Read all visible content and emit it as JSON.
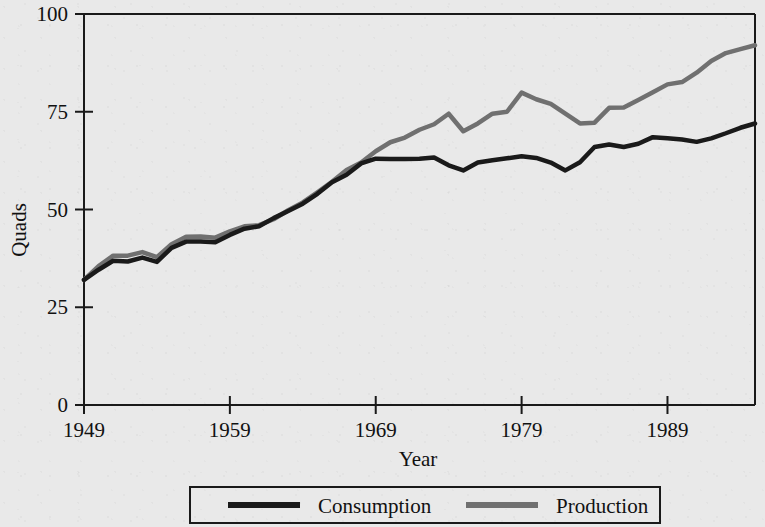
{
  "chart_data": {
    "type": "line",
    "title": "",
    "xlabel": "Year",
    "ylabel": "Quads",
    "xlim": [
      1949,
      1995
    ],
    "ylim": [
      0,
      100
    ],
    "xticks": [
      1949,
      1959,
      1969,
      1979,
      1989
    ],
    "yticks": [
      0,
      25,
      50,
      75,
      100
    ],
    "xtick_labels": [
      "1949",
      "1959",
      "1969",
      "1979",
      "1989"
    ],
    "ytick_labels": [
      "0",
      "25",
      "50",
      "75",
      "100"
    ],
    "grid": false,
    "legend_position": "bottom-outside",
    "x": [
      1949,
      1950,
      1951,
      1952,
      1953,
      1954,
      1955,
      1956,
      1957,
      1958,
      1959,
      1960,
      1961,
      1962,
      1963,
      1964,
      1965,
      1966,
      1967,
      1968,
      1969,
      1970,
      1971,
      1972,
      1973,
      1974,
      1975,
      1976,
      1977,
      1978,
      1979,
      1980,
      1981,
      1982,
      1983,
      1984,
      1985,
      1986,
      1987,
      1988,
      1989,
      1990,
      1991,
      1992,
      1993,
      1994,
      1995
    ],
    "series": [
      {
        "name": "Consumption",
        "color": "#1a1a1a",
        "values": [
          32.0,
          34.6,
          36.9,
          36.7,
          37.7,
          36.6,
          40.2,
          41.8,
          41.8,
          41.6,
          43.5,
          45.1,
          45.7,
          47.8,
          49.6,
          51.5,
          54.0,
          57.0,
          58.9,
          61.8,
          63.0,
          62.9,
          62.9,
          63.0,
          63.3,
          61.3,
          60.0,
          62.0,
          62.6,
          63.1,
          63.6,
          63.2,
          62.0,
          60.0,
          62.1,
          66.0,
          66.6,
          66.0,
          66.8,
          68.5,
          68.2,
          67.9,
          67.3,
          68.2,
          69.5,
          70.9,
          72.0
        ]
      },
      {
        "name": "Production",
        "color": "#707070",
        "values": [
          32.0,
          35.5,
          38.2,
          38.2,
          39.1,
          37.8,
          41.1,
          43.0,
          43.1,
          42.8,
          44.4,
          45.7,
          46.0,
          47.5,
          49.8,
          51.8,
          54.4,
          57.1,
          60.1,
          62.0,
          64.9,
          67.2,
          68.4,
          70.4,
          71.8,
          74.5,
          70.0,
          72.0,
          74.5,
          75.0,
          79.9,
          78.2,
          77.0,
          74.5,
          72.0,
          72.2,
          76.0,
          76.1,
          78.0,
          80.0,
          82.0,
          82.6,
          85.0,
          88.0,
          90.0,
          91.0,
          92.0
        ]
      }
    ]
  },
  "axes": {
    "y_title": "Quads",
    "x_title": "Year"
  },
  "legend": {
    "items": [
      {
        "label": "Consumption",
        "color": "#1a1a1a"
      },
      {
        "label": "Production",
        "color": "#707070"
      }
    ]
  }
}
